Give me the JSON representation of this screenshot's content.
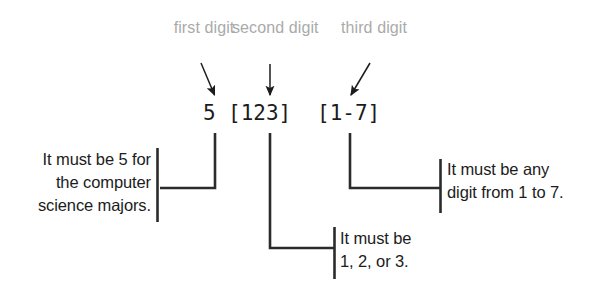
{
  "diagram": {
    "ink_color": "#1c1c1c",
    "label_color": "#aaaaaa",
    "background": "#ffffff",
    "callouts": [
      {
        "id": "first",
        "label": "first\ndigit",
        "arrow": "arrow-down-right-icon"
      },
      {
        "id": "second",
        "label": "second\ndigit",
        "arrow": "arrow-down-icon"
      },
      {
        "id": "third",
        "label": "third\ndigit",
        "arrow": "arrow-down-left-icon"
      }
    ],
    "pattern": {
      "first": "5",
      "second": "[123]",
      "third": "[1-7]",
      "full": "5 [123] [1-7]"
    },
    "notes": {
      "left": "It must be 5 for\nthe computer\nscience majors.",
      "middle": "It must be\n1, 2, or 3.",
      "right": "It must be any\ndigit from 1 to 7."
    }
  }
}
